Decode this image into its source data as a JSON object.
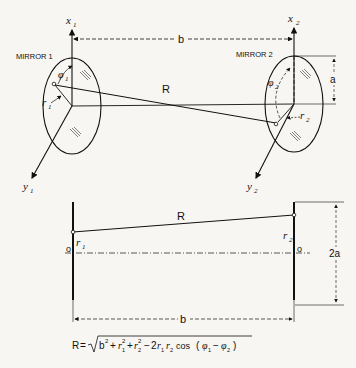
{
  "figure": {
    "type": "two-mirror resonator geometry",
    "top_view": {
      "axes": {
        "x1": "x",
        "x1_sub": "1",
        "x2": "x",
        "x2_sub": "2",
        "y1": "y",
        "y1_sub": "1",
        "y2": "y",
        "y2_sub": "2"
      },
      "mirror1_label": "MIRROR 1",
      "mirror2_label": "MIRROR 2",
      "spacing_label": "b",
      "distance_label": "R",
      "radius_label": "a",
      "r1": "r",
      "r1_sub": "1",
      "r2": "r",
      "r2_sub": "2",
      "phi1": "φ",
      "phi1_sub": "1",
      "phi2": "φ",
      "phi2_sub": "2"
    },
    "side_view": {
      "distance_label": "R",
      "r1": "r",
      "r1_sub": "1",
      "r2": "r",
      "r2_sub": "2",
      "origin_left": "o",
      "origin_right": "o",
      "aperture_label": "2a",
      "spacing_label": "b"
    },
    "formula": {
      "lhs": "R",
      "text": "R = √(b² + r₁² + r₂² − 2r₁ r₂ cos (φ₁ − φ₂))",
      "cos": "cos"
    }
  }
}
